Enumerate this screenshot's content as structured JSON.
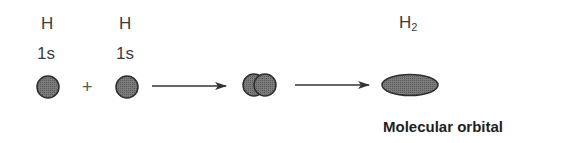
{
  "atoms": [
    {
      "element": "H",
      "orbital": "1s"
    },
    {
      "element": "H",
      "orbital": "1s"
    }
  ],
  "operator": "+",
  "product": {
    "label_base": "H",
    "label_subscript": "2"
  },
  "caption": "Molecular orbital",
  "colors": {
    "fill": "#727272",
    "stroke": "#2e2e2e",
    "arrow": "#333333"
  }
}
